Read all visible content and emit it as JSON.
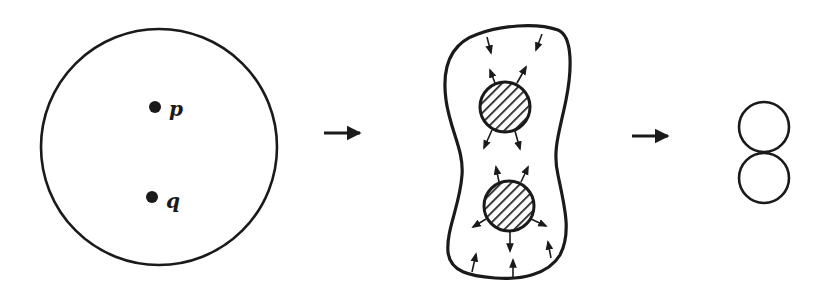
{
  "figure": {
    "stage1": {
      "points": [
        {
          "label": "p"
        },
        {
          "label": "q"
        }
      ]
    },
    "stage2": {
      "description": "deformed region with two hatched disks around p and q, arrows indicating flow"
    },
    "stage3": {
      "description": "two tangent circles (figure-eight)"
    },
    "arrows": [
      "stage1-to-stage2",
      "stage2-to-stage3"
    ],
    "colors": {
      "ink": "#1a1a1a",
      "background": "#ffffff"
    }
  }
}
